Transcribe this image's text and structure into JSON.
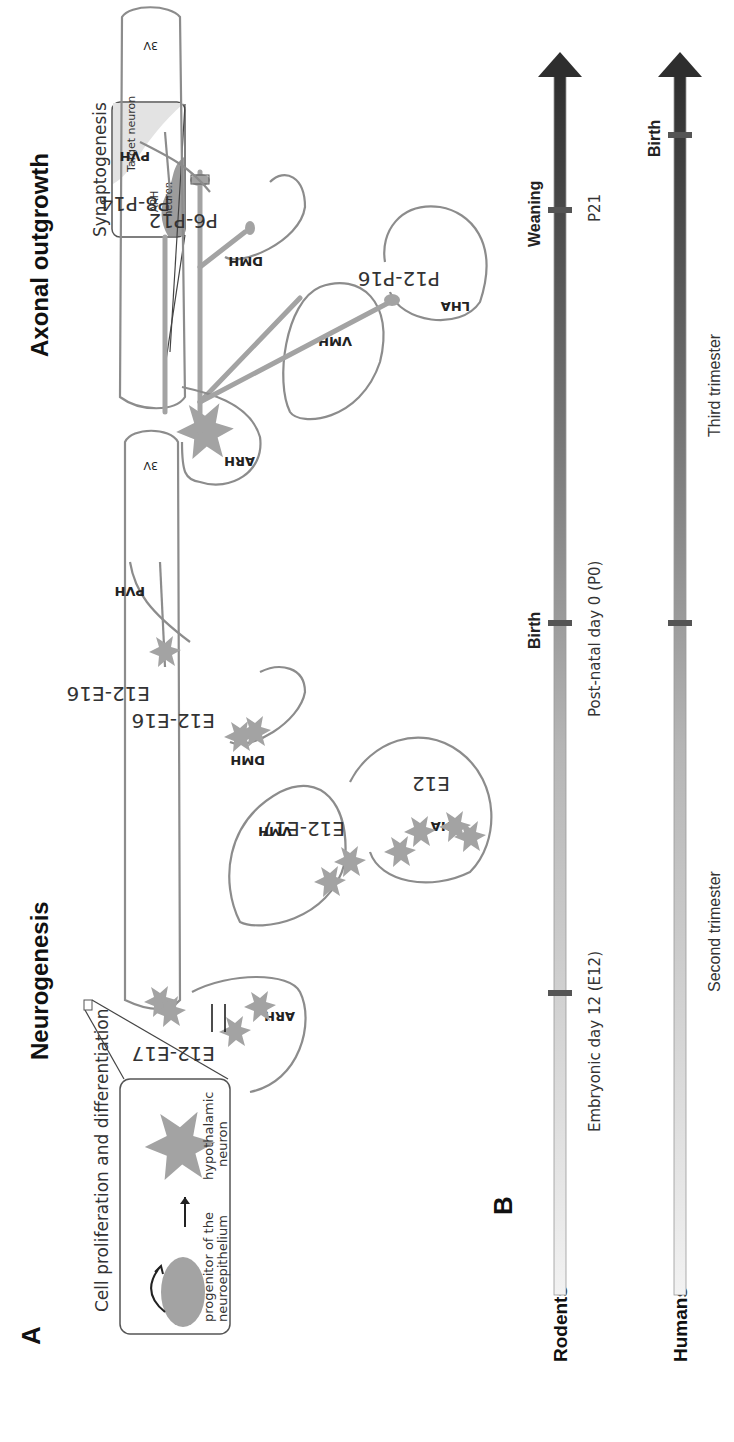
{
  "figure": {
    "panel_a_label": "A",
    "panel_b_label": "B",
    "neurogenesis": {
      "title": "Neurogenesis",
      "third_ventricle": "3V",
      "inset_title": "Cell proliferation and differentiation",
      "inset_progenitor": [
        "progenitor of the",
        "neuroepithelium"
      ],
      "inset_neuron": [
        "hypothalamic",
        "neuron"
      ],
      "nuclei": [
        {
          "name": "PVH",
          "stage": "E12-E16"
        },
        {
          "name": "DMH",
          "stage": "E12-E16"
        },
        {
          "name": "VMH",
          "stage": "E12-E17"
        },
        {
          "name": "LHA",
          "stage": "E12"
        },
        {
          "name": "ARH",
          "stage": "E12-E17"
        }
      ]
    },
    "axonal_outgrowth": {
      "title": "Axonal outgrowth",
      "third_ventricle": "3V",
      "inset_title": "Synaptogenesis",
      "inset_target": "Target neuron",
      "inset_arh": [
        "ARH",
        "neuron"
      ],
      "nuclei": [
        {
          "name": "PVH",
          "stage": "P8-P14"
        },
        {
          "name": "DMH",
          "stage": "P6-P12"
        },
        {
          "name": "VMH",
          "stage": ""
        },
        {
          "name": "LHA",
          "stage": "P12-P16"
        },
        {
          "name": "ARH",
          "stage": ""
        }
      ]
    },
    "timelines": {
      "rodents": {
        "label": "Rodents",
        "events": [
          {
            "name": "",
            "detail": "Embryonic day 12 (E12)"
          },
          {
            "name": "Birth",
            "detail": "Post-natal day 0 (P0)"
          },
          {
            "name": "Weaning",
            "detail": "P21"
          }
        ]
      },
      "humans": {
        "label": "Humans",
        "periods": [
          "Second trimester",
          "Third trimester"
        ],
        "events": [
          {
            "name": "Birth"
          }
        ]
      }
    },
    "colors": {
      "region_outline": "#8c8c8c",
      "neuron_fill": "#a3a3a3",
      "timeline_dark": "#2e2e2e",
      "timeline_light": "#e8e8e8"
    }
  }
}
